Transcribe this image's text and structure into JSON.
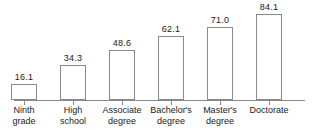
{
  "chart_data": {
    "type": "bar",
    "title": "",
    "subtitle": "",
    "xlabel": "",
    "ylabel": "",
    "categories": [
      "Ninth grade",
      "High school",
      "Associate degree",
      "Bachelor's degree",
      "Master's degree",
      "Doctorate"
    ],
    "category_lines": [
      [
        "Ninth",
        "grade"
      ],
      [
        "High",
        "school"
      ],
      [
        "Associate",
        "degree"
      ],
      [
        "Bachelor's",
        "degree"
      ],
      [
        "Master's",
        "degree"
      ],
      [
        "Doctorate",
        ""
      ]
    ],
    "values": [
      16.1,
      34.3,
      48.6,
      62.1,
      71.0,
      84.1
    ],
    "value_labels": [
      "16.1",
      "34.3",
      "48.6",
      "62.1",
      "71.0",
      "84.1"
    ],
    "ylim": [
      0,
      90
    ],
    "grid": false,
    "legend": false,
    "legend_position": "none",
    "y_axis_visible": false,
    "x_axis_visible": true,
    "bar_fill_color": "#ffffff",
    "bar_border_color": "#8a8a8a",
    "axis_color": "#8a8a8a",
    "text_color": "#1a1a1a",
    "background_color": "#ffffff"
  }
}
